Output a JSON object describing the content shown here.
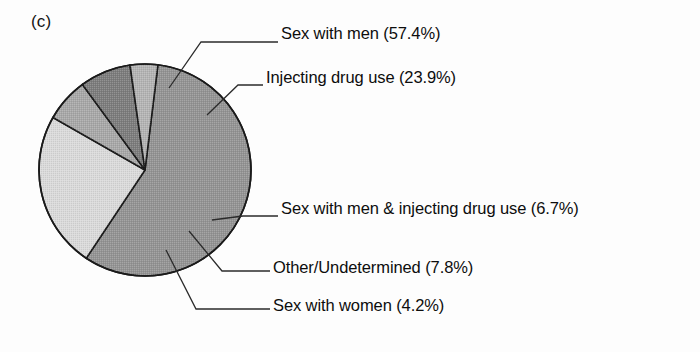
{
  "figure": {
    "panel_label": "(c)",
    "background_color": "#fdfdfd",
    "line_color": "#1a1a1a"
  },
  "chart_data": {
    "type": "pie",
    "title": "",
    "subtitle": "",
    "xlabel": "",
    "ylabel": "",
    "grid": false,
    "legend_position": "callout-labels-right",
    "panel": "(c)",
    "start_angle_deg": 7,
    "direction": "clockwise",
    "center": {
      "x": 145,
      "y": 170
    },
    "radius": 106,
    "categories": [
      "Sex with men",
      "Injecting drug use",
      "Sex with men & injecting drug use",
      "Other/Undetermined",
      "Sex with women"
    ],
    "values": [
      57.4,
      23.9,
      6.7,
      7.8,
      4.2
    ],
    "units": "percent",
    "total": 100.0,
    "slices": [
      {
        "label": "Sex with men",
        "percent": 57.4,
        "percent_text": "57.4%",
        "label_text": "Sex with men (57.4%)",
        "fill": "#949494",
        "order": 0
      },
      {
        "label": "Injecting drug use",
        "percent": 23.9,
        "percent_text": "23.9%",
        "label_text": "Injecting drug use (23.9%)",
        "fill": "#dadada",
        "order": 1
      },
      {
        "label": "Sex with men & injecting drug use",
        "percent": 6.7,
        "percent_text": "6.7%",
        "label_text": "Sex with men & injecting drug use (6.7%)",
        "fill": "#a8a8a8",
        "order": 2
      },
      {
        "label": "Other/Undetermined",
        "percent": 7.8,
        "percent_text": "7.8%",
        "label_text": "Other/Undetermined (7.8%)",
        "fill": "#7d7d7d",
        "order": 3
      },
      {
        "label": "Sex with women",
        "percent": 4.2,
        "percent_text": "4.2%",
        "label_text": "Sex with women (4.2%)",
        "fill": "#b4b4b4",
        "order": 4
      }
    ]
  }
}
